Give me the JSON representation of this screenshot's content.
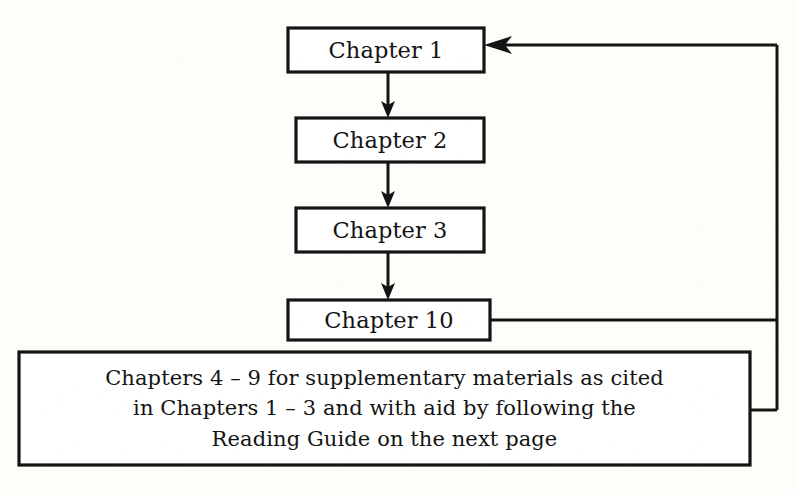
{
  "diagram": {
    "type": "flowchart",
    "background_color": "#fdfdfa",
    "line_color": "#141414",
    "text_color": "#141414",
    "nodes": [
      {
        "id": "chapter-1",
        "label": "Chapter 1",
        "shape": "rectangle",
        "x": 288,
        "y": 28,
        "width": 196,
        "height": 44
      },
      {
        "id": "chapter-2",
        "label": "Chapter 2",
        "shape": "rectangle",
        "x": 296,
        "y": 118,
        "width": 188,
        "height": 44
      },
      {
        "id": "chapter-3",
        "label": "Chapter 3",
        "shape": "rectangle",
        "x": 296,
        "y": 208,
        "width": 188,
        "height": 44
      },
      {
        "id": "chapter-10",
        "label": "Chapter 10",
        "shape": "rectangle",
        "x": 288,
        "y": 300,
        "width": 202,
        "height": 40
      },
      {
        "id": "supplementary-materials",
        "shape": "rectangle",
        "x": 19,
        "y": 352,
        "width": 731,
        "height": 113,
        "lines": [
          "Chapters 4 – 9 for supplementary materials as cited",
          "in Chapters 1 – 3 and with aid by following the",
          "Reading Guide on the next page"
        ]
      }
    ],
    "edges": [
      {
        "id": "edge-ch1-ch2",
        "from": "chapter-1",
        "to": "chapter-2",
        "arrow": "down"
      },
      {
        "id": "edge-ch2-ch3",
        "from": "chapter-2",
        "to": "chapter-3",
        "arrow": "down"
      },
      {
        "id": "edge-ch3-ch10",
        "from": "chapter-3",
        "to": "chapter-10",
        "arrow": "down"
      },
      {
        "id": "edge-ch10-ch1-feedback",
        "from": "chapter-10",
        "to": "chapter-1",
        "arrow": "left",
        "routing": "right-up-left"
      },
      {
        "id": "edge-supplementary-bus",
        "from": "supplementary-materials",
        "to": "chapter-1",
        "arrow": "none",
        "routing": "right-up"
      }
    ]
  }
}
